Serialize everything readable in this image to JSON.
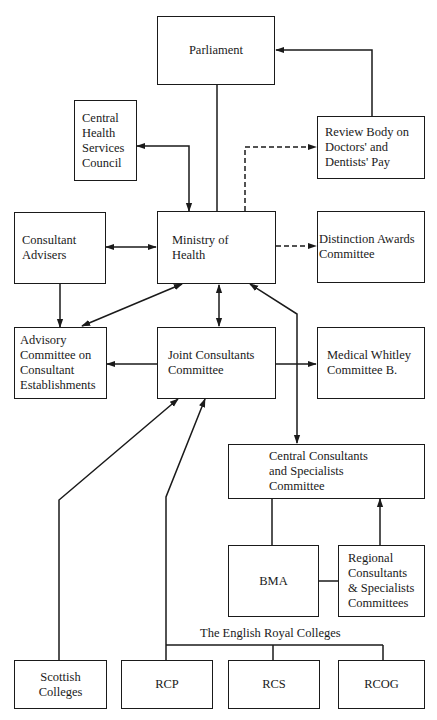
{
  "diagram": {
    "nodes": {
      "parliament": {
        "label": "Parliament"
      },
      "chsc": {
        "label": "Central\nHealth\nServices\nCouncil"
      },
      "review_body": {
        "label": "Review Body on\nDoctors' and\nDentists' Pay"
      },
      "consultant_advisers": {
        "label": "Consultant\nAdvisers"
      },
      "ministry": {
        "label": "Ministry of\nHealth"
      },
      "distinction_awards": {
        "label": "Distinction Awards\nCommittee"
      },
      "advisory_committee": {
        "label": "Advisory\nCommittee on\nConsultant\nEstablishments"
      },
      "joint_consultants": {
        "label": "Joint Consultants\nCommittee"
      },
      "medical_whitley": {
        "label": "Medical Whitley\nCommittee B."
      },
      "central_consultants": {
        "label": "Central Consultants\nand Specialists\nCommittee"
      },
      "bma": {
        "label": "BMA"
      },
      "regional": {
        "label": "Regional\nConsultants\n& Specialists\nCommittees"
      },
      "scottish": {
        "label": "Scottish\nColleges"
      },
      "rcp": {
        "label": "RCP"
      },
      "rcs": {
        "label": "RCS"
      },
      "rcog": {
        "label": "RCOG"
      }
    },
    "group_label": "The English Royal Colleges",
    "edges": [
      {
        "from": "ministry",
        "to": "parliament",
        "style": "solid",
        "arrow": "none"
      },
      {
        "from": "review_body",
        "to": "parliament",
        "style": "solid",
        "arrow": "end"
      },
      {
        "from": "chsc",
        "to": "ministry",
        "style": "solid",
        "arrow": "both"
      },
      {
        "from": "ministry",
        "to": "review_body",
        "style": "dashed",
        "arrow": "end"
      },
      {
        "from": "consultant_advisers",
        "to": "ministry",
        "style": "solid",
        "arrow": "both"
      },
      {
        "from": "ministry",
        "to": "distinction_awards",
        "style": "dashed",
        "arrow": "end"
      },
      {
        "from": "consultant_advisers",
        "to": "advisory_committee",
        "style": "solid",
        "arrow": "end"
      },
      {
        "from": "ministry",
        "to": "advisory_committee",
        "style": "solid",
        "arrow": "both"
      },
      {
        "from": "ministry",
        "to": "joint_consultants",
        "style": "solid",
        "arrow": "both"
      },
      {
        "from": "ministry",
        "to": "central_consultants",
        "style": "solid",
        "arrow": "both"
      },
      {
        "from": "joint_consultants",
        "to": "advisory_committee",
        "style": "solid",
        "arrow": "end"
      },
      {
        "from": "joint_consultants",
        "to": "medical_whitley",
        "style": "solid",
        "arrow": "end"
      },
      {
        "from": "central_consultants",
        "to": "bma",
        "style": "solid",
        "arrow": "none"
      },
      {
        "from": "regional",
        "to": "central_consultants",
        "style": "solid",
        "arrow": "end"
      },
      {
        "from": "bma",
        "to": "regional",
        "style": "solid",
        "arrow": "none"
      },
      {
        "from": "scottish",
        "to": "joint_consultants",
        "style": "solid",
        "arrow": "end"
      },
      {
        "from": "rcp",
        "to": "joint_consultants",
        "style": "solid",
        "arrow": "end"
      },
      {
        "from": "rcp",
        "to": "english_royal_colleges_bar",
        "style": "solid",
        "arrow": "none"
      },
      {
        "from": "rcs",
        "to": "english_royal_colleges_bar",
        "style": "solid",
        "arrow": "none"
      },
      {
        "from": "rcog",
        "to": "english_royal_colleges_bar",
        "style": "solid",
        "arrow": "none"
      }
    ]
  }
}
